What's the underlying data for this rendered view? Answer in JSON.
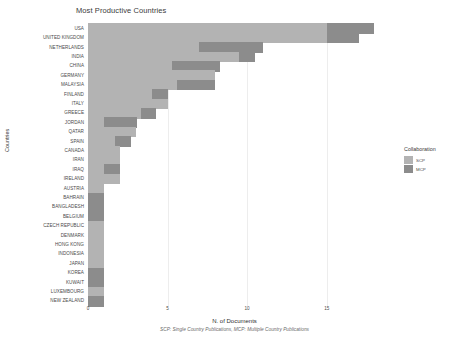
{
  "chart_data": {
    "type": "bar",
    "orientation": "horizontal",
    "stacked": true,
    "title": "Most Productive Countries",
    "xlabel": "N. of Documents",
    "ylabel": "Countries",
    "caption": "SCP: Single Country Publications, MCP: Multiple Country Publications",
    "xlim": [
      0,
      18.6
    ],
    "xticks": [
      0,
      5,
      10,
      15
    ],
    "xtick_labels": [
      "0",
      "5",
      "10",
      "15"
    ],
    "grid": true,
    "legend": {
      "title": "Collaboration",
      "position": "right",
      "entries": [
        {
          "name": "SCP",
          "color": "#b3b3b3"
        },
        {
          "name": "MCP",
          "color": "#8c8c8c"
        }
      ]
    },
    "series": [
      {
        "name": "SCP",
        "color": "#b3b3b3"
      },
      {
        "name": "MCP",
        "color": "#8c8c8c"
      }
    ],
    "categories": [
      "USA",
      "UNITED KINGDOM",
      "NETHERLANDS",
      "INDIA",
      "CHINA",
      "GERMANY",
      "MALAYSIA",
      "FINLAND",
      "ITALY",
      "GREECE",
      "JORDAN",
      "QATAR",
      "SPAIN",
      "CANADA",
      "IRAN",
      "IRAQ",
      "IRELAND",
      "AUSTRIA",
      "BAHRAIN",
      "BANGLADESH",
      "BELGIUM",
      "CZECH REPUBLIC",
      "DENMARK",
      "HONG KONG",
      "INDONESIA",
      "JAPAN",
      "KOREA",
      "KUWAIT",
      "LUXEMBOURG",
      "NEW ZEALAND"
    ],
    "data": [
      {
        "country": "USA",
        "scp": 15,
        "mcp": 3,
        "total": 18
      },
      {
        "country": "UNITED KINGDOM",
        "scp": 15,
        "mcp": 2,
        "total": 17
      },
      {
        "country": "NETHERLANDS",
        "scp": 7,
        "mcp": 4,
        "total": 11
      },
      {
        "country": "INDIA",
        "scp": 9.5,
        "mcp": 1,
        "total": 10.5
      },
      {
        "country": "CHINA",
        "scp": 5.3,
        "mcp": 3,
        "total": 8.3
      },
      {
        "country": "GERMANY",
        "scp": 8,
        "mcp": 0,
        "total": 8
      },
      {
        "country": "MALAYSIA",
        "scp": 5.6,
        "mcp": 2.4,
        "total": 8
      },
      {
        "country": "FINLAND",
        "scp": 4,
        "mcp": 1,
        "total": 5
      },
      {
        "country": "ITALY",
        "scp": 5,
        "mcp": 0,
        "total": 5
      },
      {
        "country": "GREECE",
        "scp": 3.3,
        "mcp": 1,
        "total": 4.3
      },
      {
        "country": "JORDAN",
        "scp": 1,
        "mcp": 2.1,
        "total": 3.1
      },
      {
        "country": "QATAR",
        "scp": 3,
        "mcp": 0,
        "total": 3
      },
      {
        "country": "SPAIN",
        "scp": 1.7,
        "mcp": 1,
        "total": 2.7
      },
      {
        "country": "CANADA",
        "scp": 2,
        "mcp": 0,
        "total": 2
      },
      {
        "country": "IRAN",
        "scp": 2,
        "mcp": 0,
        "total": 2
      },
      {
        "country": "IRAQ",
        "scp": 1,
        "mcp": 1,
        "total": 2
      },
      {
        "country": "IRELAND",
        "scp": 2,
        "mcp": 0,
        "total": 2
      },
      {
        "country": "AUSTRIA",
        "scp": 1,
        "mcp": 0,
        "total": 1
      },
      {
        "country": "BAHRAIN",
        "scp": 0,
        "mcp": 1,
        "total": 1
      },
      {
        "country": "BANGLADESH",
        "scp": 0,
        "mcp": 1,
        "total": 1
      },
      {
        "country": "BELGIUM",
        "scp": 0,
        "mcp": 1,
        "total": 1
      },
      {
        "country": "CZECH REPUBLIC",
        "scp": 1,
        "mcp": 0,
        "total": 1
      },
      {
        "country": "DENMARK",
        "scp": 1,
        "mcp": 0,
        "total": 1
      },
      {
        "country": "HONG KONG",
        "scp": 1,
        "mcp": 0,
        "total": 1
      },
      {
        "country": "INDONESIA",
        "scp": 1,
        "mcp": 0,
        "total": 1
      },
      {
        "country": "JAPAN",
        "scp": 1,
        "mcp": 0,
        "total": 1
      },
      {
        "country": "KOREA",
        "scp": 0,
        "mcp": 1,
        "total": 1
      },
      {
        "country": "KUWAIT",
        "scp": 0,
        "mcp": 1,
        "total": 1
      },
      {
        "country": "LUXEMBOURG",
        "scp": 1,
        "mcp": 0,
        "total": 1
      },
      {
        "country": "NEW ZEALAND",
        "scp": 0,
        "mcp": 1,
        "total": 1
      }
    ]
  }
}
